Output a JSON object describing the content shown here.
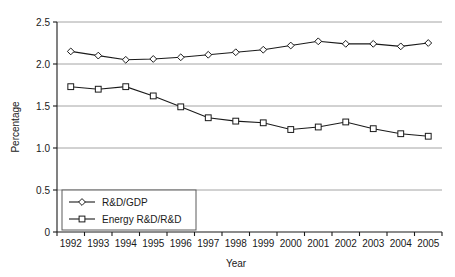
{
  "chart_data": {
    "type": "line",
    "title": "",
    "xlabel": "Year",
    "ylabel": "Percentage",
    "categories": [
      "1992",
      "1993",
      "1994",
      "1995",
      "1996",
      "1997",
      "1998",
      "1999",
      "2000",
      "2001",
      "2002",
      "2003",
      "2004",
      "2005"
    ],
    "x": [
      1992,
      1993,
      1994,
      1995,
      1996,
      1997,
      1998,
      1999,
      2000,
      2001,
      2002,
      2003,
      2004,
      2005
    ],
    "series": [
      {
        "name": "R&D/GDP",
        "marker": "diamond",
        "values": [
          2.15,
          2.1,
          2.05,
          2.06,
          2.08,
          2.11,
          2.14,
          2.17,
          2.22,
          2.27,
          2.24,
          2.24,
          2.21,
          2.25
        ]
      },
      {
        "name": "Energy R&D/R&D",
        "marker": "square",
        "values": [
          1.73,
          1.7,
          1.73,
          1.62,
          1.49,
          1.36,
          1.32,
          1.3,
          1.22,
          1.25,
          1.31,
          1.23,
          1.17,
          1.14
        ]
      }
    ],
    "ylim": [
      0,
      2.5
    ],
    "yticks": [
      0,
      0.5,
      1.0,
      1.5,
      2.0,
      2.5
    ],
    "ytick_labels": [
      "0",
      "0.5",
      "1.0",
      "1.5",
      "2.0",
      "2.5"
    ],
    "grid": true,
    "grid_axis": "y",
    "legend_position": "bottom-left",
    "colors": {
      "line": "#1a1a1a",
      "grid": "#9a9a9a",
      "marker_fill": "#ffffff",
      "background": "#ffffff"
    }
  }
}
